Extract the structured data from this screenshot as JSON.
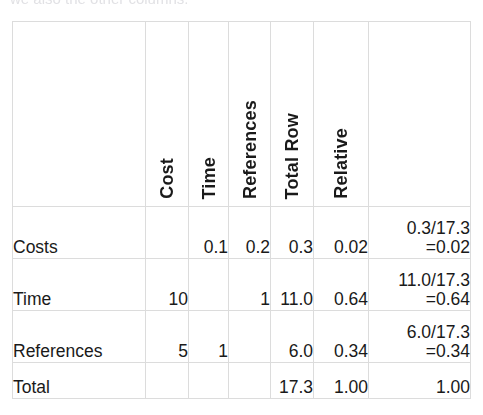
{
  "caption": {
    "cut_off_line": "we also the other columns."
  },
  "table": {
    "name": "pairwise-comparison-matrix",
    "column_headers": [
      {
        "key": "label",
        "label": "",
        "rotated": false
      },
      {
        "key": "cost",
        "label": "Cost",
        "rotated": true
      },
      {
        "key": "time",
        "label": "Time",
        "rotated": true
      },
      {
        "key": "refs",
        "label": "References",
        "rotated": true
      },
      {
        "key": "totalrow",
        "label": "Total Row",
        "rotated": true
      },
      {
        "key": "relative",
        "label": "Relative",
        "rotated": true
      },
      {
        "key": "calc",
        "label": "",
        "rotated": false
      }
    ],
    "rows": [
      {
        "label": "Costs",
        "cells": [
          {
            "value": "",
            "shaded": true
          },
          {
            "value": "0.1",
            "shaded": false
          },
          {
            "value": "0.2",
            "shaded": false
          },
          {
            "value": "0.3",
            "shaded": false
          },
          {
            "value": "0.02",
            "shaded": false
          }
        ],
        "calc_line1": "0.3/17.3",
        "calc_line2": "=0.02"
      },
      {
        "label": "Time",
        "cells": [
          {
            "value": "10",
            "shaded": false
          },
          {
            "value": "",
            "shaded": true
          },
          {
            "value": "1",
            "shaded": false
          },
          {
            "value": "11.0",
            "shaded": false
          },
          {
            "value": "0.64",
            "shaded": false
          }
        ],
        "calc_line1": "11.0/17.3",
        "calc_line2": "=0.64"
      },
      {
        "label": "References",
        "cells": [
          {
            "value": "5",
            "shaded": false
          },
          {
            "value": "1",
            "shaded": false
          },
          {
            "value": "",
            "shaded": true
          },
          {
            "value": "6.0",
            "shaded": false
          },
          {
            "value": "0.34",
            "shaded": false
          }
        ],
        "calc_line1": "6.0/17.3",
        "calc_line2": "=0.34"
      },
      {
        "label": "Total",
        "cells": [
          {
            "value": "",
            "shaded": false
          },
          {
            "value": "",
            "shaded": false
          },
          {
            "value": "",
            "shaded": false
          },
          {
            "value": "17.3",
            "shaded": false
          },
          {
            "value": "1.00",
            "shaded": false
          }
        ],
        "calc_line1": "",
        "calc_line2": "1.00"
      }
    ]
  },
  "colors": {
    "page_background": "#ffffff",
    "grid_line": "#dcdcdc",
    "text": "#1a1a1a",
    "diagonal_fill": "#e3e3e3"
  }
}
